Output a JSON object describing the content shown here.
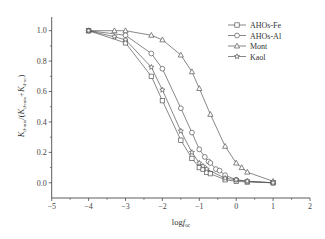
{
  "chart_data": {
    "type": "line",
    "title": "",
    "xlabel": "logf_oc",
    "xlabel_main": "log",
    "xlabel_italic": "f",
    "xlabel_sub": "oc",
    "ylabel": "K_d-mix/(K_d-mix+K_d-oc)",
    "ylabel_parts": {
      "k1": "K",
      "sub1": "d-mix",
      "mid": "/(",
      "k2": "K",
      "sub2": "d-mix",
      "plus": "+",
      "k3": "K",
      "sub3": "d-oc",
      "end": ")"
    },
    "xlim": [
      -5,
      2
    ],
    "ylim": [
      -0.1,
      1.09
    ],
    "xticks": [
      -5,
      -4,
      -3,
      -2,
      -1,
      0,
      1,
      2
    ],
    "xtick_labels": [
      "−5",
      "−4",
      "−3",
      "−2",
      "−1",
      "0",
      "1",
      "2"
    ],
    "yticks": [
      0.0,
      0.2,
      0.4,
      0.6,
      0.8,
      1.0
    ],
    "ytick_labels": [
      "0.0",
      "0.2",
      "0.4",
      "0.6",
      "0.8",
      "1.0"
    ],
    "grid": false,
    "legend_position": "upper right",
    "series": [
      {
        "name": "AHOs-Fe",
        "marker": "square",
        "x": [
          -4,
          -3,
          -2.3,
          -2,
          -1.5,
          -1.2,
          -1,
          -0.9,
          -0.8,
          -0.7,
          -0.3,
          0,
          0.3,
          1
        ],
        "y": [
          1.0,
          0.92,
          0.7,
          0.54,
          0.28,
          0.16,
          0.1,
          0.09,
          0.07,
          0.06,
          0.02,
          0.01,
          0.005,
          0.0
        ]
      },
      {
        "name": "AHOs-Al",
        "marker": "circle",
        "x": [
          -4,
          -3,
          -2.3,
          -2,
          -1.5,
          -1.2,
          -1,
          -0.85,
          -0.75,
          -0.7,
          -0.55,
          -0.45,
          -0.3,
          0,
          0.3,
          1
        ],
        "y": [
          1.0,
          0.97,
          0.85,
          0.75,
          0.49,
          0.33,
          0.22,
          0.17,
          0.14,
          0.13,
          0.09,
          0.08,
          0.05,
          0.02,
          0.01,
          0.0
        ]
      },
      {
        "name": "Mont",
        "marker": "triangle",
        "x": [
          -4,
          -3.3,
          -3,
          -2.3,
          -2,
          -1.5,
          -1.2,
          -1,
          -0.7,
          -0.3,
          0,
          0.15,
          0.3,
          1
        ],
        "y": [
          1.0,
          1.0,
          1.0,
          0.97,
          0.94,
          0.84,
          0.73,
          0.62,
          0.45,
          0.24,
          0.13,
          0.1,
          0.07,
          0.01
        ]
      },
      {
        "name": "Kaol",
        "marker": "star",
        "x": [
          -4,
          -3.3,
          -3,
          -2.3,
          -2,
          -1.5,
          -1.2,
          -1,
          -0.9,
          -0.8,
          -0.3,
          0,
          0.3,
          1
        ],
        "y": [
          1.0,
          0.96,
          0.94,
          0.76,
          0.61,
          0.34,
          0.2,
          0.13,
          0.11,
          0.09,
          0.03,
          0.02,
          0.01,
          0.0
        ]
      }
    ]
  },
  "colors": {
    "line": "#555555",
    "axis": "#333333",
    "background": "#ffffff"
  }
}
